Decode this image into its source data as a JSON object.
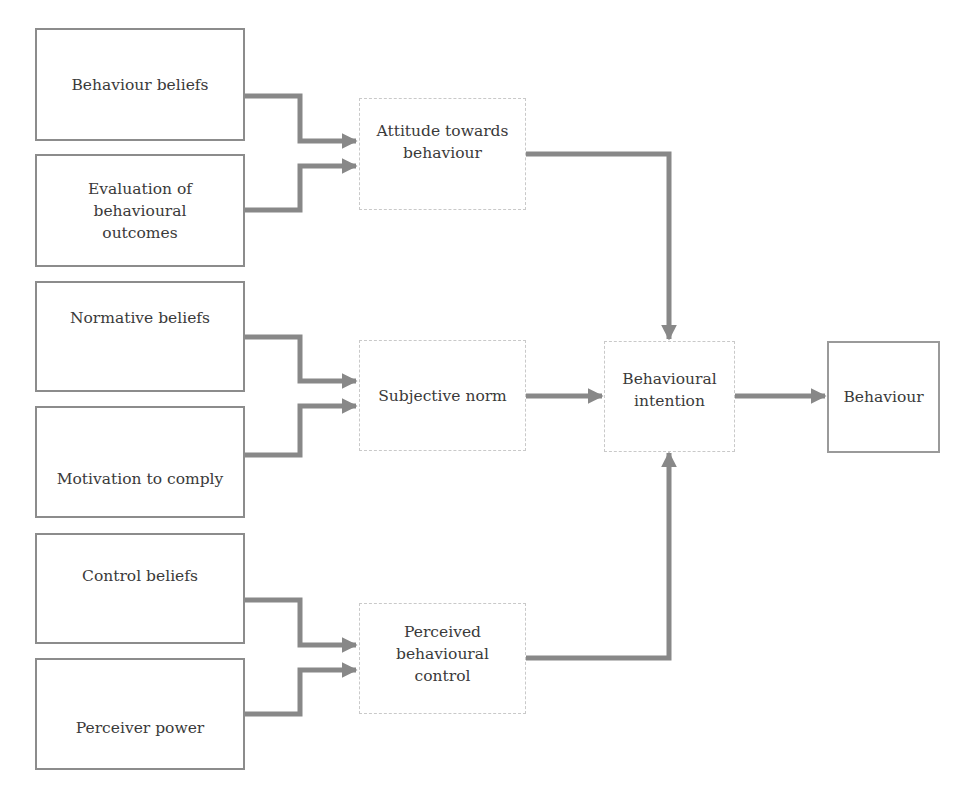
{
  "diagram": {
    "type": "flowchart",
    "colors": {
      "connector": "#888888",
      "input_border": "#8c8c8c",
      "construct_border": "#c9c9c9",
      "text": "#3a3a3a",
      "background": "#ffffff"
    },
    "nodes": {
      "behaviour_beliefs": {
        "label": "Behaviour beliefs"
      },
      "evaluation_outcomes": {
        "label": "Evaluation of behavioural outcomes"
      },
      "normative_beliefs": {
        "label": "Normative beliefs"
      },
      "motivation_comply": {
        "label": "Motivation to comply"
      },
      "control_beliefs": {
        "label": "Control beliefs"
      },
      "perceiver_power": {
        "label": "Perceiver power"
      },
      "attitude": {
        "label": "Attitude towards behaviour"
      },
      "subjective_norm": {
        "label": "Subjective norm"
      },
      "pbc": {
        "label": "Perceived behavioural control"
      },
      "intention": {
        "label": "Behavioural intention"
      },
      "behaviour": {
        "label": "Behaviour"
      }
    },
    "edges": [
      {
        "from": "behaviour_beliefs",
        "to": "attitude"
      },
      {
        "from": "evaluation_outcomes",
        "to": "attitude"
      },
      {
        "from": "normative_beliefs",
        "to": "subjective_norm"
      },
      {
        "from": "motivation_comply",
        "to": "subjective_norm"
      },
      {
        "from": "control_beliefs",
        "to": "pbc"
      },
      {
        "from": "perceiver_power",
        "to": "pbc"
      },
      {
        "from": "attitude",
        "to": "intention"
      },
      {
        "from": "subjective_norm",
        "to": "intention"
      },
      {
        "from": "pbc",
        "to": "intention"
      },
      {
        "from": "intention",
        "to": "behaviour"
      }
    ]
  }
}
